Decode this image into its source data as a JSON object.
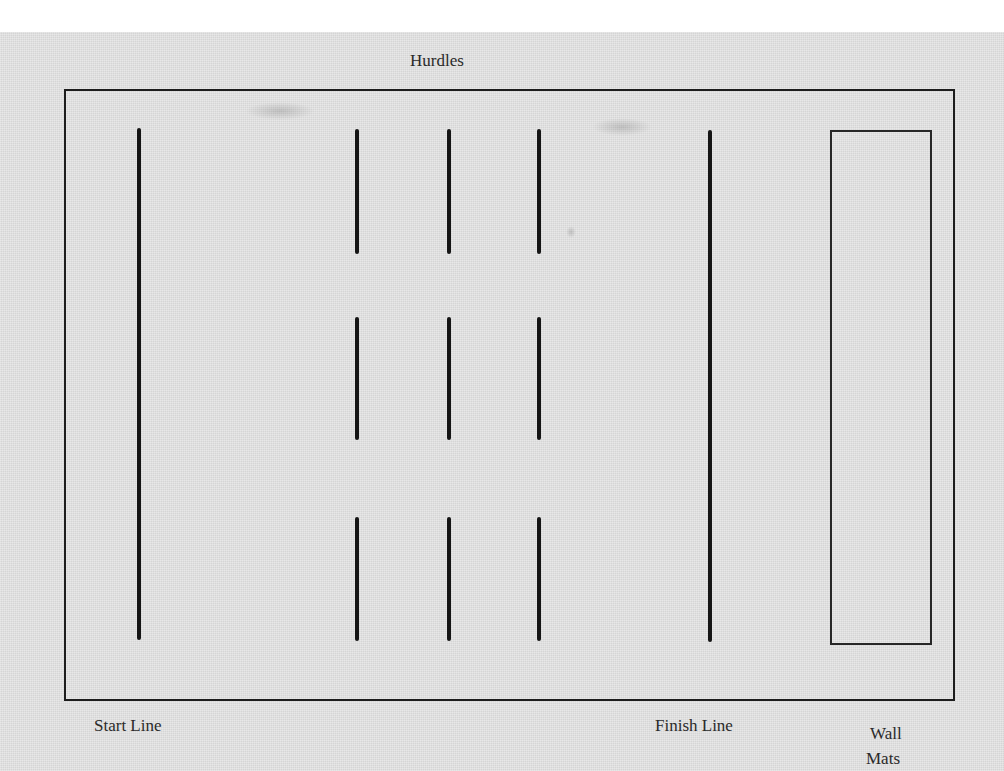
{
  "diagram": {
    "title": "Hurdles",
    "labels": {
      "start": "Start Line",
      "finish": "Finish Line",
      "wall_mats_line1": "Wall",
      "wall_mats_line2": "Mats"
    },
    "elements": {
      "start_line": {
        "x": 139,
        "y1": 128,
        "y2": 640
      },
      "finish_line": {
        "x": 710,
        "y1": 130,
        "y2": 642
      },
      "hurdle_columns_x": [
        357,
        449,
        539
      ],
      "hurdle_rows": [
        {
          "y1": 129,
          "y2": 254
        },
        {
          "y1": 317,
          "y2": 440
        },
        {
          "y1": 517,
          "y2": 641
        }
      ],
      "wall_mats_box": {
        "x1": 831,
        "y1": 131,
        "x2": 930,
        "y2": 643
      },
      "gym_boundary": {
        "x1": 65,
        "y1": 90,
        "x2": 953,
        "y2": 699
      }
    }
  }
}
